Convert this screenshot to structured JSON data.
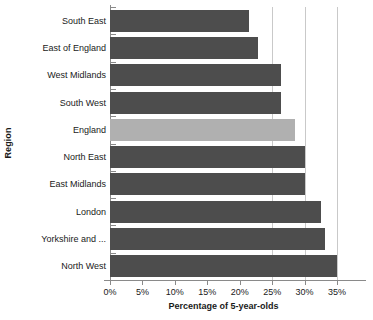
{
  "chart_data": {
    "type": "bar",
    "orientation": "horizontal",
    "title": "",
    "xlabel": "Percentage of 5-year-olds",
    "ylabel": "Region",
    "xlim": [
      0,
      35
    ],
    "xtick_labels": [
      "0%",
      "5%",
      "10%",
      "15%",
      "20%",
      "25%",
      "30%",
      "35%"
    ],
    "xticks": [
      0,
      5,
      10,
      15,
      20,
      25,
      30,
      35
    ],
    "grid": true,
    "gridlines_at": [
      25,
      30,
      35
    ],
    "legend": "none",
    "categories": [
      "South East",
      "East of England",
      "West Midlands",
      "South West",
      "England",
      "North East",
      "East Midlands",
      "London",
      "Yorkshire and ...",
      "North West"
    ],
    "values": [
      21.5,
      22.8,
      26.3,
      26.3,
      28.6,
      30.0,
      30.0,
      32.5,
      33.2,
      35.0
    ],
    "bar_colors": [
      "#4d4d4d",
      "#4d4d4d",
      "#4d4d4d",
      "#4d4d4d",
      "#b0b0b0",
      "#4d4d4d",
      "#4d4d4d",
      "#4d4d4d",
      "#4d4d4d",
      "#4d4d4d"
    ],
    "highlight_category": "England",
    "colors": {
      "bar_default": "#4d4d4d",
      "bar_highlight": "#b0b0b0",
      "gridline": "#c9c9c9",
      "axis": "#8a8a8a",
      "text": "#1a1a1a",
      "background": "#ffffff"
    }
  }
}
